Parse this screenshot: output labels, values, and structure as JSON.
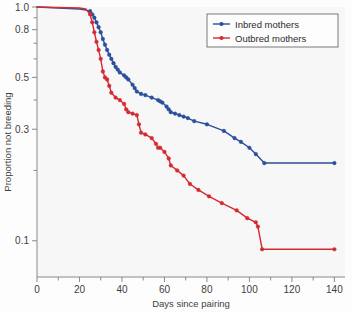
{
  "chart_data": {
    "type": "line",
    "title": "",
    "subtitle": "",
    "xlabel": "Days since pairing",
    "ylabel": "Proportion not breeding",
    "xlim": [
      0,
      145
    ],
    "ylim": [
      0.07,
      1.0
    ],
    "yscale": "log",
    "grid": false,
    "legend_position": "top-right",
    "x_ticks": [
      0,
      20,
      40,
      60,
      80,
      100,
      120,
      140
    ],
    "x_tick_labels": [
      "0",
      "20",
      "40",
      "60",
      "80",
      "100",
      "120",
      "140"
    ],
    "x_minor_ticks": [
      10,
      30,
      50,
      70,
      90,
      110,
      130
    ],
    "y_ticks": [
      1.0,
      0.8,
      0.5,
      0.3,
      0.1
    ],
    "y_tick_labels": [
      "1.0",
      "0.8",
      "0.5",
      "0.3",
      "0.1"
    ],
    "y_minor_ticks": [
      0.9,
      0.7,
      0.6,
      0.4,
      0.2
    ],
    "series": [
      {
        "name": "Inbred mothers",
        "color": "#2a4f9b",
        "marker": "circle",
        "x": [
          0,
          10,
          20,
          23,
          25,
          26,
          27,
          28,
          29,
          30,
          31,
          32,
          33,
          34,
          35,
          36,
          37,
          38,
          39,
          41,
          42,
          43,
          45,
          46,
          47,
          49,
          51,
          54,
          57,
          58,
          59,
          61,
          62,
          63,
          65,
          67,
          69,
          71,
          74,
          80,
          88,
          93,
          96,
          100,
          103,
          107,
          140
        ],
        "y": [
          1.0,
          0.99,
          0.98,
          0.97,
          0.96,
          0.93,
          0.9,
          0.86,
          0.82,
          0.78,
          0.73,
          0.69,
          0.655,
          0.625,
          0.6,
          0.575,
          0.555,
          0.54,
          0.525,
          0.51,
          0.5,
          0.49,
          0.465,
          0.45,
          0.435,
          0.425,
          0.42,
          0.41,
          0.4,
          0.395,
          0.39,
          0.375,
          0.365,
          0.355,
          0.35,
          0.345,
          0.34,
          0.335,
          0.325,
          0.315,
          0.295,
          0.275,
          0.265,
          0.25,
          0.235,
          0.215,
          0.215
        ]
      },
      {
        "name": "Outbred mothers",
        "color": "#d42a32",
        "marker": "circle",
        "x": [
          0,
          10,
          20,
          23,
          25,
          26,
          27,
          28,
          29,
          30,
          31,
          32,
          33,
          34,
          35,
          37,
          39,
          41,
          42,
          43,
          45,
          47,
          48,
          49,
          51,
          54,
          56,
          57,
          58,
          60,
          62,
          63,
          66,
          69,
          72,
          76,
          81,
          87,
          94,
          99,
          103,
          104,
          106,
          140
        ],
        "y": [
          1.0,
          0.995,
          0.99,
          0.98,
          0.93,
          0.86,
          0.78,
          0.71,
          0.655,
          0.6,
          0.53,
          0.5,
          0.49,
          0.46,
          0.43,
          0.41,
          0.4,
          0.385,
          0.365,
          0.355,
          0.35,
          0.345,
          0.315,
          0.29,
          0.285,
          0.275,
          0.26,
          0.25,
          0.25,
          0.24,
          0.225,
          0.21,
          0.2,
          0.19,
          0.175,
          0.165,
          0.155,
          0.145,
          0.135,
          0.125,
          0.12,
          0.115,
          0.092,
          0.092
        ]
      }
    ]
  },
  "legend": {
    "entries": [
      {
        "label": "Inbred mothers",
        "color": "#2a4f9b"
      },
      {
        "label": "Outbred mothers",
        "color": "#d42a32"
      }
    ]
  },
  "axes": {
    "x_title": "Days since pairing",
    "y_title": "Proportion not breeding"
  }
}
